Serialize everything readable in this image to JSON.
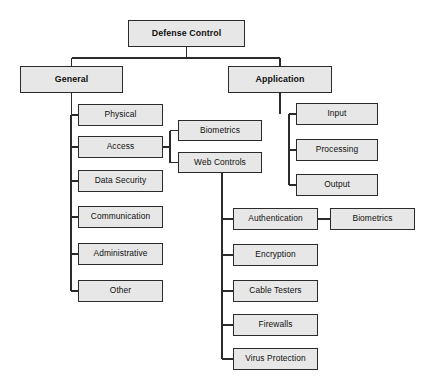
{
  "diagram": {
    "title": "Defense Control",
    "type": "hierarchy-tree",
    "stroke_color": "#2b2b2b",
    "node_fill_color": "#e7e7e7",
    "background_color": "#ffffff",
    "nodes": [
      {
        "id": "defense-control",
        "label": "Defense Control",
        "level": 0,
        "x": 128,
        "y": 20,
        "w": 117,
        "h": 27
      },
      {
        "id": "general",
        "label": "General",
        "level": 1,
        "x": 20,
        "y": 66,
        "w": 103,
        "h": 27
      },
      {
        "id": "application",
        "label": "Application",
        "level": 1,
        "x": 228,
        "y": 66,
        "w": 104,
        "h": 27
      },
      {
        "id": "physical",
        "label": "Physical",
        "level": 2,
        "x": 78,
        "y": 104,
        "w": 85,
        "h": 22
      },
      {
        "id": "access",
        "label": "Access",
        "level": 2,
        "x": 78,
        "y": 136,
        "w": 85,
        "h": 22
      },
      {
        "id": "data-security",
        "label": "Data Security",
        "level": 2,
        "x": 78,
        "y": 170,
        "w": 85,
        "h": 22
      },
      {
        "id": "communication",
        "label": "Communication",
        "level": 2,
        "x": 78,
        "y": 206,
        "w": 85,
        "h": 22
      },
      {
        "id": "administrative",
        "label": "Administrative",
        "level": 2,
        "x": 78,
        "y": 243,
        "w": 85,
        "h": 22
      },
      {
        "id": "other",
        "label": "Other",
        "level": 2,
        "x": 78,
        "y": 280,
        "w": 85,
        "h": 22
      },
      {
        "id": "biometrics-access",
        "label": "Biometrics",
        "level": 3,
        "x": 178,
        "y": 120,
        "w": 84,
        "h": 21
      },
      {
        "id": "web-controls",
        "label": "Web Controls",
        "level": 3,
        "x": 178,
        "y": 152,
        "w": 84,
        "h": 21
      },
      {
        "id": "input",
        "label": "Input",
        "level": 2,
        "x": 296,
        "y": 103,
        "w": 82,
        "h": 22
      },
      {
        "id": "processing",
        "label": "Processing",
        "level": 2,
        "x": 296,
        "y": 139,
        "w": 82,
        "h": 22
      },
      {
        "id": "output",
        "label": "Output",
        "level": 2,
        "x": 296,
        "y": 174,
        "w": 82,
        "h": 22
      },
      {
        "id": "authentication",
        "label": "Authentication",
        "level": 4,
        "x": 233,
        "y": 208,
        "w": 85,
        "h": 22
      },
      {
        "id": "biometrics-auth",
        "label": "Biometrics",
        "level": 5,
        "x": 330,
        "y": 208,
        "w": 85,
        "h": 22
      },
      {
        "id": "encryption",
        "label": "Encryption",
        "level": 4,
        "x": 233,
        "y": 244,
        "w": 85,
        "h": 22
      },
      {
        "id": "cable-testers",
        "label": "Cable Testers",
        "level": 4,
        "x": 233,
        "y": 280,
        "w": 85,
        "h": 22
      },
      {
        "id": "firewalls",
        "label": "Firewalls",
        "level": 4,
        "x": 233,
        "y": 314,
        "w": 85,
        "h": 22
      },
      {
        "id": "virus-protection",
        "label": "Virus Protection",
        "level": 4,
        "x": 233,
        "y": 348,
        "w": 85,
        "h": 22
      }
    ],
    "edges": [
      {
        "from": "defense-control",
        "to": "general"
      },
      {
        "from": "defense-control",
        "to": "application"
      },
      {
        "from": "general",
        "to": "physical"
      },
      {
        "from": "general",
        "to": "access"
      },
      {
        "from": "general",
        "to": "data-security"
      },
      {
        "from": "general",
        "to": "communication"
      },
      {
        "from": "general",
        "to": "administrative"
      },
      {
        "from": "general",
        "to": "other"
      },
      {
        "from": "access",
        "to": "biometrics-access"
      },
      {
        "from": "access",
        "to": "web-controls"
      },
      {
        "from": "application",
        "to": "input"
      },
      {
        "from": "application",
        "to": "processing"
      },
      {
        "from": "application",
        "to": "output"
      },
      {
        "from": "web-controls",
        "to": "authentication"
      },
      {
        "from": "web-controls",
        "to": "encryption"
      },
      {
        "from": "web-controls",
        "to": "cable-testers"
      },
      {
        "from": "web-controls",
        "to": "firewalls"
      },
      {
        "from": "web-controls",
        "to": "virus-protection"
      },
      {
        "from": "authentication",
        "to": "biometrics-auth"
      }
    ]
  }
}
